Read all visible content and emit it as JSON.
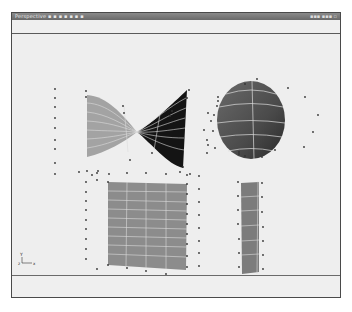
{
  "window": {
    "title": "Perspective ▪ ▪ ▪ ▪ ▪ ▪ ▪",
    "right_info": "▪▪▪ ▪▪▪ ▫"
  },
  "viewport": {
    "view_name": "Perspective",
    "axis_indicator": {
      "y_label": "Y",
      "x_label": "X",
      "z_label": "z"
    },
    "objects": [
      {
        "name": "twisted-surface",
        "type": "nurbs-surface",
        "colors": [
          "#a0a0a0",
          "#151515"
        ]
      },
      {
        "name": "sphere",
        "type": "nurbs-sphere",
        "color": "#505050"
      },
      {
        "name": "plane-grid",
        "type": "nurbs-plane",
        "color": "#8a8a8a"
      },
      {
        "name": "strip",
        "type": "nurbs-strip",
        "color": "#7a7a7a"
      }
    ]
  },
  "colors": {
    "frame": "#4a4a4a",
    "viewport_bg": "#eeeeee",
    "titlebar": "#7a7a7a",
    "wire": "#dcdcdc",
    "cv_dot": "#333333"
  }
}
